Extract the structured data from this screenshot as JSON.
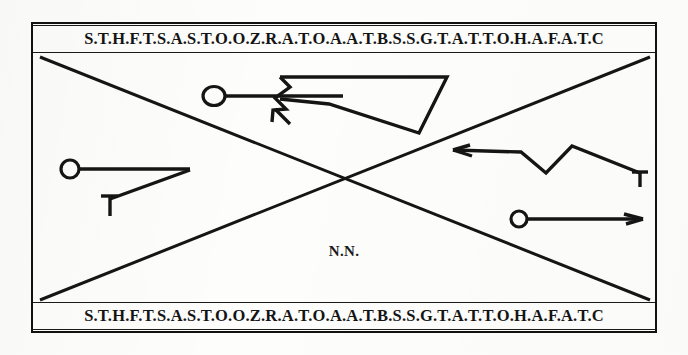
{
  "plate": {
    "caption_center": "N.N.",
    "band_top_text": "S.T.H.F.T.S.A.S.T.O.O.Z.R.A.T.O.A.A.T.B.S.S.G.T.A.T.T.O.H.A.F.A.T.C",
    "band_bottom_text": "S.T.H.F.T.S.A.S.T.O.O.Z.R.A.T.O.A.A.T.B.S.S.G.T.A.T.T.O.H.A.F.A.T.C",
    "ink_color": "#151515",
    "paper_color": "#fdfdfc"
  },
  "figures": {
    "upper_left_person": "stick-figure-with-round-head-upper",
    "upper_wedge": "triangular-wedge-shape",
    "left_person": "stick-figure-with-round-head-left",
    "right_zigzag": "zigzag-line-right",
    "lower_right_person": "stick-figure-with-round-head-lower-right"
  },
  "geometry": {
    "diagonal_a": "top-left to bottom-right",
    "diagonal_b": "bottom-left to top-right"
  }
}
